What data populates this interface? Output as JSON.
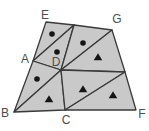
{
  "diagram": {
    "width": 149,
    "height": 131,
    "background": "#ffffff",
    "region_fill": "#c9c9c9",
    "line_color": "#3a3a3a",
    "marker_color": "#151515",
    "label_color": "#4d4d4d",
    "vertices": {
      "E": [
        46,
        22
      ],
      "P": [
        74,
        25
      ],
      "G": [
        112,
        30
      ],
      "A": [
        33,
        61
      ],
      "D": [
        61,
        70
      ],
      "H": [
        125,
        72
      ],
      "B": [
        14,
        112
      ],
      "C": [
        65,
        110
      ],
      "F": [
        136,
        110
      ]
    },
    "unlabeled_points": [
      "P",
      "H"
    ],
    "regions": [
      {
        "points": [
          "E",
          "P",
          "A"
        ],
        "marker": "dot"
      },
      {
        "points": [
          "A",
          "P",
          "D"
        ],
        "marker": "dot"
      },
      {
        "points": [
          "P",
          "G",
          "D"
        ],
        "marker": "dot"
      },
      {
        "points": [
          "G",
          "H",
          "D"
        ],
        "marker": "triangle"
      },
      {
        "points": [
          "A",
          "D",
          "B"
        ],
        "marker": "dot"
      },
      {
        "points": [
          "B",
          "D",
          "C"
        ],
        "marker": "triangle"
      },
      {
        "points": [
          "D",
          "H",
          "C"
        ],
        "marker": "triangle"
      },
      {
        "points": [
          "C",
          "H",
          "F"
        ],
        "marker": "triangle"
      }
    ],
    "markers": [
      {
        "type": "dot",
        "x": 52,
        "y": 34
      },
      {
        "type": "dot",
        "x": 57,
        "y": 52
      },
      {
        "type": "dot",
        "x": 83,
        "y": 43
      },
      {
        "type": "dot",
        "x": 37,
        "y": 79
      },
      {
        "type": "triangle",
        "x": 98,
        "y": 57
      },
      {
        "type": "triangle",
        "x": 49,
        "y": 99
      },
      {
        "type": "triangle",
        "x": 83,
        "y": 89
      },
      {
        "type": "triangle",
        "x": 113,
        "y": 95
      }
    ],
    "labels": [
      {
        "text": "E",
        "x": 45,
        "y": 19
      },
      {
        "text": "G",
        "x": 117,
        "y": 23
      },
      {
        "text": "A",
        "x": 25,
        "y": 63
      },
      {
        "text": "D",
        "x": 56,
        "y": 66
      },
      {
        "text": "B",
        "x": 5,
        "y": 117
      },
      {
        "text": "C",
        "x": 66,
        "y": 124
      },
      {
        "text": "F",
        "x": 142,
        "y": 118
      }
    ]
  }
}
